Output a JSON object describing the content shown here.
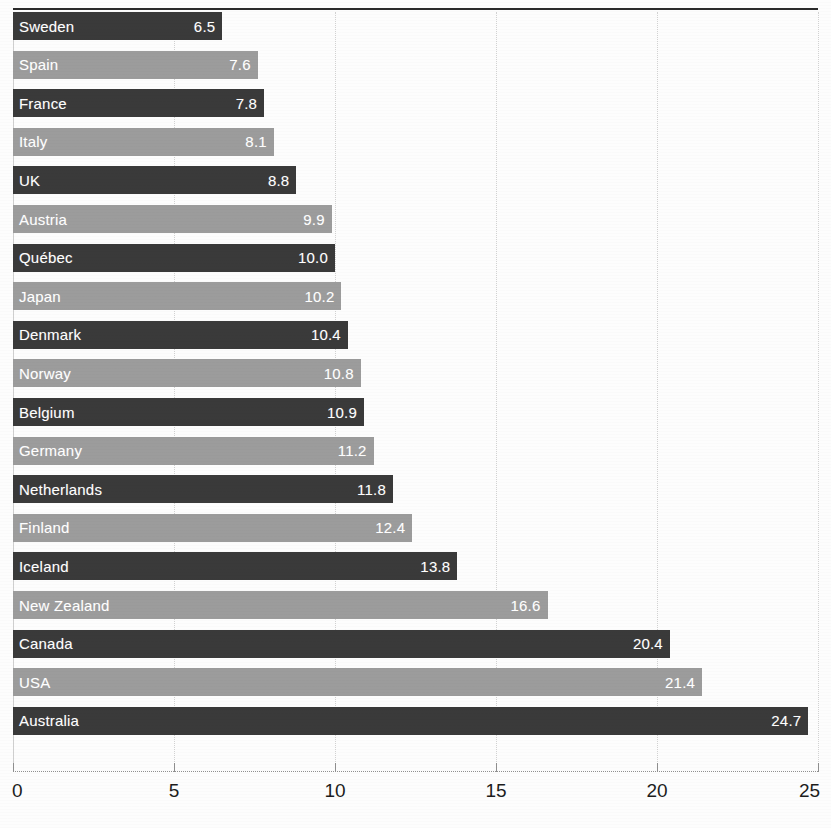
{
  "chart_data": {
    "type": "bar",
    "orientation": "horizontal",
    "title": "",
    "xlabel": "",
    "ylabel": "",
    "xlim": [
      0,
      25
    ],
    "xticks": [
      0,
      5,
      10,
      15,
      20,
      25
    ],
    "xtick_labels": [
      "0",
      "5",
      "10",
      "15",
      "20",
      "25"
    ],
    "grid": true,
    "grid_axis": "x",
    "legend": "none",
    "sorted": "ascending",
    "value_label_position": "inside-end",
    "bar_colors": {
      "dark": "#3a3a3a",
      "light": "#9c9c9c",
      "pattern": "alternating"
    },
    "categories": [
      "Sweden",
      "Spain",
      "France",
      "Italy",
      "UK",
      "Austria",
      "Québec",
      "Japan",
      "Denmark",
      "Norway",
      "Belgium",
      "Germany",
      "Netherlands",
      "Finland",
      "Iceland",
      "New Zealand",
      "Canada",
      "USA",
      "Australia"
    ],
    "values": [
      6.5,
      7.6,
      7.8,
      8.1,
      8.8,
      9.9,
      10.0,
      10.2,
      10.4,
      10.8,
      10.9,
      11.2,
      11.8,
      12.4,
      13.8,
      16.6,
      20.4,
      21.4,
      24.7
    ],
    "value_labels": [
      "6.5",
      "7.6",
      "7.8",
      "8.1",
      "8.8",
      "9.9",
      "10.0",
      "10.2",
      "10.4",
      "10.8",
      "10.9",
      "11.2",
      "11.8",
      "12.4",
      "13.8",
      "16.6",
      "20.4",
      "21.4",
      "24.7"
    ],
    "bars": [
      {
        "label": "Sweden",
        "value": 6.5,
        "value_label": "6.5",
        "shade": "dark"
      },
      {
        "label": "Spain",
        "value": 7.6,
        "value_label": "7.6",
        "shade": "light"
      },
      {
        "label": "France",
        "value": 7.8,
        "value_label": "7.8",
        "shade": "dark"
      },
      {
        "label": "Italy",
        "value": 8.1,
        "value_label": "8.1",
        "shade": "light"
      },
      {
        "label": "UK",
        "value": 8.8,
        "value_label": "8.8",
        "shade": "dark"
      },
      {
        "label": "Austria",
        "value": 9.9,
        "value_label": "9.9",
        "shade": "light"
      },
      {
        "label": "Québec",
        "value": 10.0,
        "value_label": "10.0",
        "shade": "dark"
      },
      {
        "label": "Japan",
        "value": 10.2,
        "value_label": "10.2",
        "shade": "light"
      },
      {
        "label": "Denmark",
        "value": 10.4,
        "value_label": "10.4",
        "shade": "dark"
      },
      {
        "label": "Norway",
        "value": 10.8,
        "value_label": "10.8",
        "shade": "light"
      },
      {
        "label": "Belgium",
        "value": 10.9,
        "value_label": "10.9",
        "shade": "dark"
      },
      {
        "label": "Germany",
        "value": 11.2,
        "value_label": "11.2",
        "shade": "light"
      },
      {
        "label": "Netherlands",
        "value": 11.8,
        "value_label": "11.8",
        "shade": "dark"
      },
      {
        "label": "Finland",
        "value": 12.4,
        "value_label": "12.4",
        "shade": "light"
      },
      {
        "label": "Iceland",
        "value": 13.8,
        "value_label": "13.8",
        "shade": "dark"
      },
      {
        "label": "New Zealand",
        "value": 16.6,
        "value_label": "16.6",
        "shade": "light"
      },
      {
        "label": "Canada",
        "value": 20.4,
        "value_label": "20.4",
        "shade": "dark"
      },
      {
        "label": "USA",
        "value": 21.4,
        "value_label": "21.4",
        "shade": "light"
      },
      {
        "label": "Australia",
        "value": 24.7,
        "value_label": "24.7",
        "shade": "dark"
      }
    ]
  },
  "layout": {
    "plot_left": 13,
    "plot_top": 12,
    "plot_width": 805,
    "row_pitch": 38.6,
    "bar_height": 28,
    "axis_y": 771
  }
}
